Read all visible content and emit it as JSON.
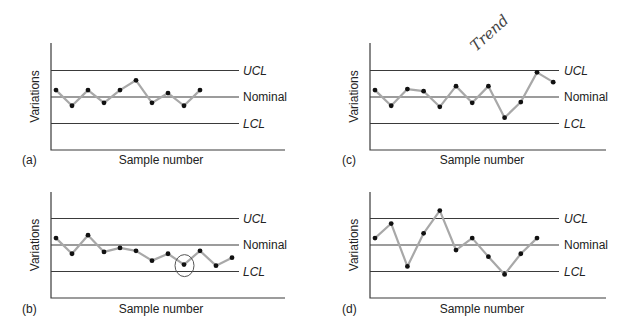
{
  "chart_data": [
    {
      "type": "line",
      "panel_label": "(a)",
      "title": "",
      "xlabel": "Sample number",
      "ylabel": "Variations",
      "control_lines": {
        "UCL": 1.0,
        "Nominal": 0.0,
        "LCL": -1.0
      },
      "control_labels": [
        "UCL",
        "Nominal",
        "LCL"
      ],
      "x": [
        1,
        2,
        3,
        4,
        5,
        6,
        7,
        8,
        9,
        10
      ],
      "values": [
        0.26,
        -0.33,
        0.26,
        -0.22,
        0.26,
        0.63,
        -0.22,
        0.15,
        -0.33,
        0.26
      ],
      "annotations": [],
      "description": "Normal random variation within control limits"
    },
    {
      "type": "line",
      "panel_label": "(b)",
      "title": "",
      "xlabel": "Sample number",
      "ylabel": "Variations",
      "control_lines": {
        "UCL": 1.0,
        "Nominal": 0.0,
        "LCL": -1.0
      },
      "control_labels": [
        "UCL",
        "Nominal",
        "LCL"
      ],
      "x": [
        1,
        2,
        3,
        4,
        5,
        6,
        7,
        8,
        9,
        10,
        11,
        12
      ],
      "values": [
        0.26,
        -0.33,
        0.37,
        -0.26,
        -0.11,
        -0.22,
        -0.59,
        -0.33,
        -0.74,
        -0.22,
        -0.78,
        -0.48
      ],
      "annotations": [
        {
          "type": "circle",
          "x": 9,
          "note": "point near LCL circled"
        }
      ],
      "description": "Downward shift toward LCL"
    },
    {
      "type": "line",
      "panel_label": "(c)",
      "title": "",
      "xlabel": "Sample number",
      "ylabel": "Variations",
      "control_lines": {
        "UCL": 1.0,
        "Nominal": 0.0,
        "LCL": -1.0
      },
      "control_labels": [
        "UCL",
        "Nominal",
        "LCL"
      ],
      "x": [
        1,
        2,
        3,
        4,
        5,
        6,
        7,
        8,
        9,
        10,
        11,
        12
      ],
      "values": [
        0.26,
        -0.33,
        0.3,
        0.22,
        -0.37,
        0.41,
        -0.22,
        0.41,
        -0.78,
        -0.19,
        0.93,
        0.56
      ],
      "annotations": [
        {
          "type": "handwritten",
          "text": "Trend"
        }
      ],
      "description": "Trend toward and beyond UCL"
    },
    {
      "type": "line",
      "panel_label": "(d)",
      "title": "",
      "xlabel": "Sample number",
      "ylabel": "Variations",
      "control_lines": {
        "UCL": 1.0,
        "Nominal": 0.0,
        "LCL": -1.0
      },
      "control_labels": [
        "UCL",
        "Nominal",
        "LCL"
      ],
      "x": [
        1,
        2,
        3,
        4,
        5,
        6,
        7,
        8,
        9,
        10,
        11
      ],
      "values": [
        0.26,
        0.81,
        -0.81,
        0.44,
        1.3,
        -0.19,
        0.26,
        -0.44,
        -1.11,
        -0.33,
        0.26
      ],
      "annotations": [],
      "description": "Erratic large swings exceeding limits"
    }
  ],
  "labels": {
    "ylabel": "Variations",
    "xlabel": "Sample number",
    "ucl": "UCL",
    "nominal": "Nominal",
    "lcl": "LCL",
    "panel_a": "(a)",
    "panel_b": "(b)",
    "panel_c": "(c)",
    "panel_d": "(d)",
    "handwritten": "Trend"
  },
  "colors": {
    "control_line": "#3a3a3a",
    "series_line": "#a8a8a8",
    "marker": "#111111"
  }
}
